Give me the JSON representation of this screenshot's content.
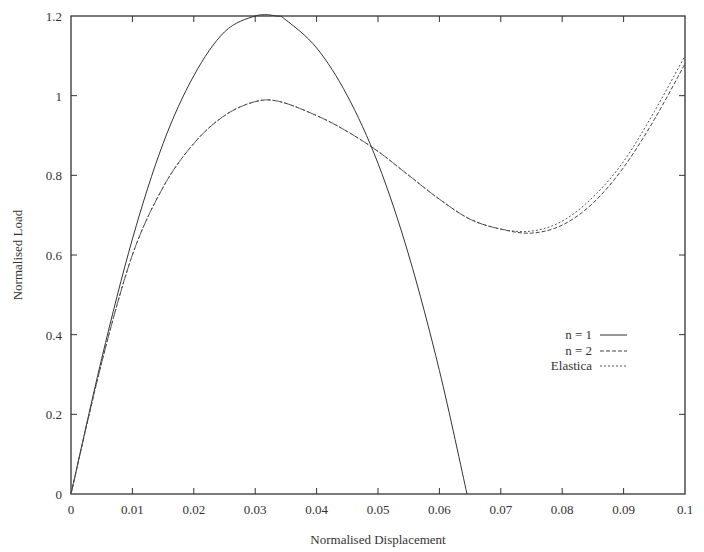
{
  "chart_data": {
    "type": "line",
    "title": "",
    "xlabel": "Normalised Displacement",
    "ylabel": "Normalised Load",
    "xlim": [
      0,
      0.1
    ],
    "ylim": [
      0,
      1.2
    ],
    "xticks": [
      "0",
      "0.01",
      "0.02",
      "0.03",
      "0.04",
      "0.05",
      "0.06",
      "0.07",
      "0.08",
      "0.09",
      "0.1"
    ],
    "yticks": [
      "0",
      "0.2",
      "0.4",
      "0.6",
      "0.8",
      "1",
      "1.2"
    ],
    "grid": false,
    "legend_position": "right-middle",
    "series": [
      {
        "name": "n = 1",
        "style": "solid",
        "x": [
          0,
          0.005,
          0.01,
          0.015,
          0.02,
          0.025,
          0.03,
          0.0335,
          0.035,
          0.04,
          0.045,
          0.05,
          0.055,
          0.06,
          0.0645
        ],
        "y": [
          0,
          0.34,
          0.64,
          0.88,
          1.05,
          1.16,
          1.2,
          1.2,
          1.19,
          1.12,
          1.0,
          0.83,
          0.6,
          0.31,
          0
        ]
      },
      {
        "name": "n = 2",
        "style": "dashed",
        "x": [
          0,
          0.005,
          0.01,
          0.015,
          0.02,
          0.025,
          0.03,
          0.034,
          0.04,
          0.045,
          0.05,
          0.055,
          0.06,
          0.065,
          0.07,
          0.075,
          0.08,
          0.085,
          0.09,
          0.095,
          0.1
        ],
        "y": [
          0,
          0.33,
          0.6,
          0.77,
          0.88,
          0.95,
          0.985,
          0.985,
          0.95,
          0.91,
          0.86,
          0.8,
          0.74,
          0.69,
          0.665,
          0.655,
          0.675,
          0.73,
          0.82,
          0.94,
          1.08
        ]
      },
      {
        "name": "Elastica",
        "style": "dotted",
        "x": [
          0,
          0.005,
          0.01,
          0.015,
          0.02,
          0.025,
          0.03,
          0.034,
          0.04,
          0.045,
          0.05,
          0.055,
          0.06,
          0.065,
          0.07,
          0.075,
          0.08,
          0.085,
          0.09,
          0.095,
          0.1
        ],
        "y": [
          0,
          0.33,
          0.6,
          0.77,
          0.88,
          0.95,
          0.985,
          0.985,
          0.95,
          0.91,
          0.86,
          0.8,
          0.74,
          0.69,
          0.665,
          0.66,
          0.685,
          0.745,
          0.835,
          0.96,
          1.1
        ]
      }
    ]
  },
  "legend": [
    {
      "label": "n = 1"
    },
    {
      "label": "n = 2"
    },
    {
      "label": "Elastica"
    }
  ]
}
